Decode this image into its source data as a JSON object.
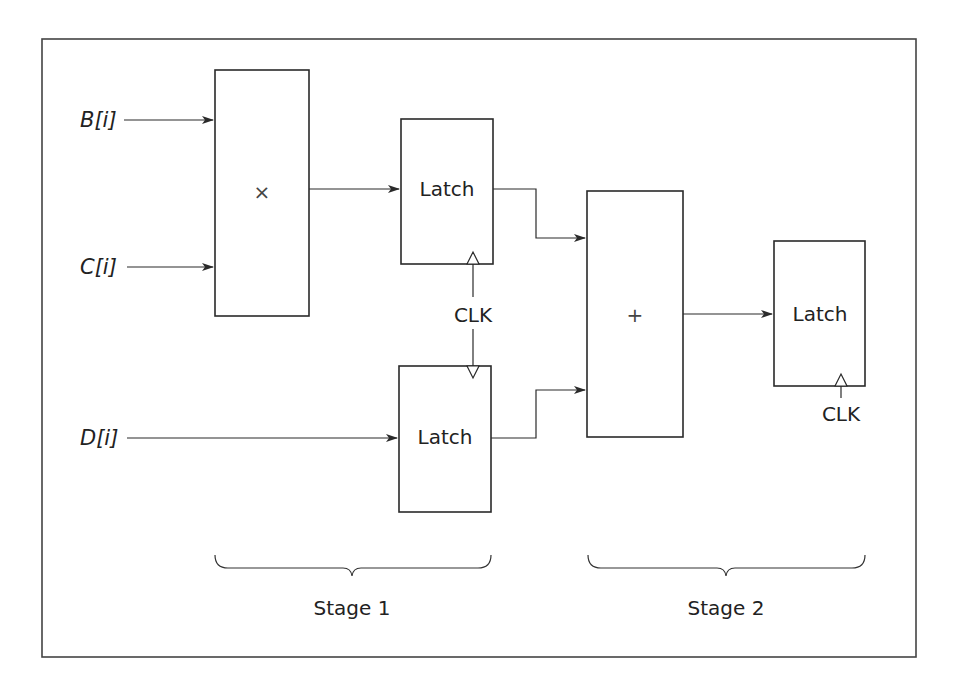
{
  "diagram": {
    "inputs": [
      {
        "id": "B",
        "label": "B[i]"
      },
      {
        "id": "C",
        "label": "C[i]"
      },
      {
        "id": "D",
        "label": "D[i]"
      }
    ],
    "blocks": {
      "multiplier": {
        "symbol": "×"
      },
      "latch1": {
        "label": "Latch"
      },
      "latch2": {
        "label": "Latch"
      },
      "adder": {
        "symbol": "+"
      },
      "latch3": {
        "label": "Latch"
      }
    },
    "clock": {
      "shared_label": "CLK",
      "stage2_label": "CLK"
    },
    "stages": [
      {
        "label": "Stage 1"
      },
      {
        "label": "Stage 2"
      }
    ],
    "colors": {
      "stroke": "#2a2a2a",
      "background": "#ffffff"
    }
  }
}
